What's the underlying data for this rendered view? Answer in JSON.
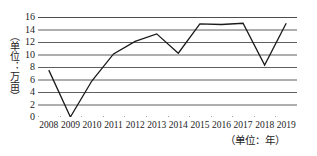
{
  "chart_data": {
    "type": "line",
    "title": "",
    "subtitle": "",
    "xlabel": "（单位：年）",
    "ylabel": "（单位：万亩）",
    "categories": [
      "2008",
      "2009",
      "2010",
      "2011",
      "2012",
      "2013",
      "2014",
      "2015",
      "2016",
      "2017",
      "2018",
      "2019"
    ],
    "x": [
      2008,
      2009,
      2010,
      2011,
      2012,
      2013,
      2014,
      2015,
      2016,
      2017,
      2018,
      2019
    ],
    "values": [
      7.5,
      0,
      5.8,
      10.1,
      12.1,
      13.3,
      10.2,
      14.9,
      14.8,
      15.0,
      8.3,
      15.0
    ],
    "series": [
      {
        "name": "面积",
        "values": [
          7.5,
          0,
          5.8,
          10.1,
          12.1,
          13.3,
          10.2,
          14.9,
          14.8,
          15.0,
          8.3,
          15.0
        ]
      }
    ],
    "ylim": [
      0,
      16
    ],
    "yticks": [
      0,
      2,
      4,
      6,
      8,
      10,
      12,
      14,
      16
    ],
    "ytick_labels": [
      "0",
      "2",
      "4",
      "6",
      "8",
      "10",
      "12",
      "14",
      "16"
    ],
    "grid": "horizontal",
    "legend": "none",
    "line_color": "#1a1a1a",
    "grid_color": "#4d4d4d",
    "axis_color": "#333333",
    "background": "#ffffff"
  }
}
